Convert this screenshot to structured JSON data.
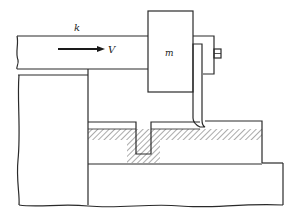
{
  "diagram": {
    "type": "mechanical-schematic",
    "labels": {
      "stiffness": "k",
      "velocity": "V",
      "mass": "m"
    },
    "colors": {
      "line": "#2a2a2a",
      "hatch": "#444444",
      "background": "#ffffff"
    }
  }
}
